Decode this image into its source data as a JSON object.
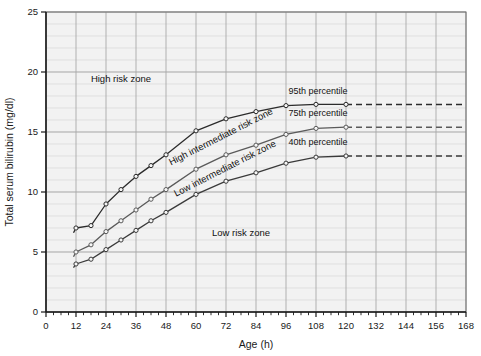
{
  "chart_data": {
    "type": "line",
    "title": "",
    "xlabel": "Age (h)",
    "ylabel": "Total serum bilirubin (mg/dl)",
    "xlim": [
      0,
      168
    ],
    "ylim": [
      0,
      25
    ],
    "xticks": [
      0,
      12,
      24,
      36,
      48,
      60,
      72,
      84,
      96,
      108,
      120,
      132,
      144,
      156,
      168
    ],
    "xtick_labels": [
      "0",
      "12",
      "24",
      "36",
      "48",
      "60",
      "72",
      "84",
      "96",
      "108",
      "120",
      "132",
      "144",
      "156",
      "168"
    ],
    "yticks": [
      0,
      5,
      10,
      15,
      20,
      25
    ],
    "ytick_labels": [
      "0",
      "5",
      "10",
      "15",
      "20",
      "25"
    ],
    "x_minor_step": 3,
    "y_minor_step": 1,
    "grid": true,
    "legend": "inline-labels",
    "series": [
      {
        "name": "95th percentile",
        "label": "95th percentile",
        "color": "#2b2b2b",
        "x": [
          12,
          18,
          24,
          30,
          36,
          42,
          48,
          60,
          72,
          84,
          96,
          108,
          120
        ],
        "y": [
          7.0,
          7.2,
          9.0,
          10.2,
          11.3,
          12.2,
          13.1,
          15.1,
          16.1,
          16.7,
          17.2,
          17.3,
          17.3
        ],
        "dashed_tail": {
          "x": [
            120,
            168
          ],
          "y": [
            17.3,
            17.3
          ]
        },
        "markers": true,
        "lead_dash": {
          "x": [
            11,
            12
          ],
          "y": [
            6.6,
            7.0
          ]
        }
      },
      {
        "name": "75th percentile",
        "label": "75th percentile",
        "color": "#5a5a5a",
        "x": [
          12,
          18,
          24,
          30,
          36,
          42,
          48,
          60,
          72,
          84,
          96,
          108,
          120
        ],
        "y": [
          5.0,
          5.6,
          6.7,
          7.6,
          8.5,
          9.4,
          10.2,
          11.9,
          13.1,
          13.9,
          14.8,
          15.3,
          15.4
        ],
        "dashed_tail": {
          "x": [
            120,
            168
          ],
          "y": [
            15.4,
            15.4
          ]
        },
        "markers": true,
        "lead_dash": {
          "x": [
            11,
            12
          ],
          "y": [
            4.6,
            5.0
          ]
        }
      },
      {
        "name": "40th percentile",
        "label": "40th percentile",
        "color": "#3a3a3a",
        "x": [
          12,
          18,
          24,
          30,
          36,
          42,
          48,
          60,
          72,
          84,
          96,
          108,
          120
        ],
        "y": [
          4.0,
          4.4,
          5.2,
          6.0,
          6.8,
          7.6,
          8.3,
          9.8,
          10.9,
          11.6,
          12.4,
          12.9,
          13.0
        ],
        "dashed_tail": {
          "x": [
            120,
            168
          ],
          "y": [
            13.0,
            13.0
          ]
        },
        "markers": true,
        "lead_dash": {
          "x": [
            11,
            12
          ],
          "y": [
            3.7,
            4.0
          ]
        }
      }
    ],
    "annotations": [
      {
        "id": "high-risk-zone",
        "text": "High risk zone",
        "x": 30,
        "y": 19.2,
        "rotation": 0
      },
      {
        "id": "high-intermediate-risk-zone",
        "text": "High intermediate risk zone",
        "x": 50,
        "y": 12.2,
        "rotation": -27
      },
      {
        "id": "low-intermediate-risk-zone",
        "text": "Low intermediate risk zone",
        "x": 52,
        "y": 9.6,
        "rotation": -27
      },
      {
        "id": "low-risk-zone",
        "text": "Low risk zone",
        "x": 78,
        "y": 6.3,
        "rotation": 0
      },
      {
        "id": "series-label-95",
        "text": "95th percentile",
        "x": 97,
        "y": 18.2,
        "rotation": 0
      },
      {
        "id": "series-label-75",
        "text": "75th percentile",
        "x": 97,
        "y": 16.3,
        "rotation": 0
      },
      {
        "id": "series-label-40",
        "text": "40th percentile",
        "x": 97,
        "y": 13.9,
        "rotation": 0
      }
    ],
    "colors": {
      "plot_background": "#f2f2f2",
      "grid_major": "#a8a8a8",
      "grid_minor": "#d8d8d8",
      "axis": "#1a1a1a",
      "page_background": "#ffffff"
    }
  }
}
